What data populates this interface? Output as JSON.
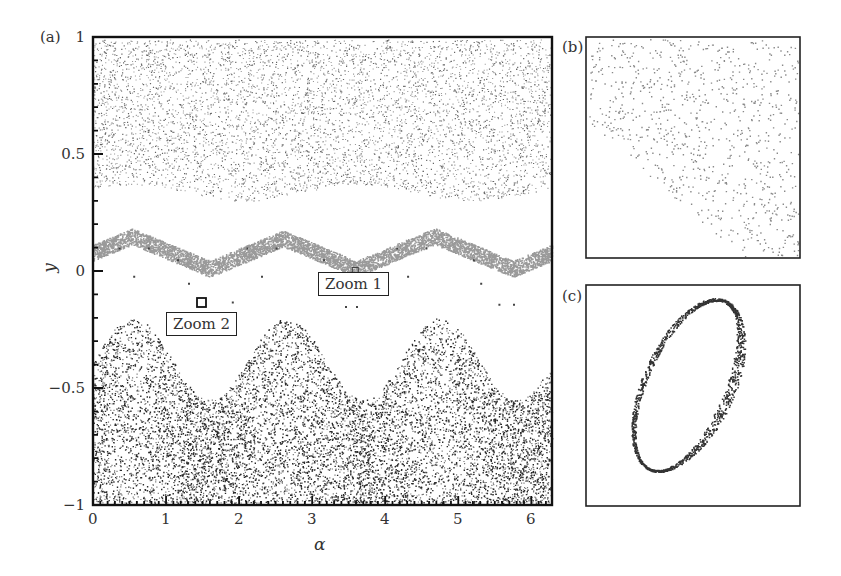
{
  "chart_data": [
    {
      "panel": "a",
      "type": "scatter",
      "title": "",
      "panel_label": "(a)",
      "xlabel": "α",
      "ylabel": "y",
      "xlim": [
        0,
        6.283
      ],
      "ylim": [
        -1,
        1
      ],
      "x_ticks": [
        "0",
        "1",
        "2",
        "3",
        "4",
        "5",
        "6"
      ],
      "y_ticks": [
        "−1",
        "−0.5",
        "0",
        "0.5",
        "1"
      ],
      "grid": false,
      "legend": null,
      "regions": [
        {
          "name": "upper chaotic sea",
          "color": "#444444",
          "y_lower_boundary": "≈0.30–0.37 (oscillating, period ≈3.14)",
          "y_upper": 1.0
        },
        {
          "name": "resonance band (gray)",
          "color": "#9a9a9a",
          "y_range_peaks": [
            0.11,
            0.18
          ],
          "y_troughs": 0.0,
          "trough_alpha": [
            1.6,
            3.6,
            5.75
          ]
        },
        {
          "name": "isolated islands (dots)",
          "color": "#444444",
          "y_values": [
            0.1,
            -0.04,
            -0.14
          ]
        },
        {
          "name": "lower chaotic sea",
          "color": "#222222",
          "upper_boundary_peaks_alpha": [
            0.55,
            2.65,
            4.75
          ],
          "upper_boundary_peak_y": -0.2,
          "upper_boundary_trough_y": -0.55,
          "y_lower": -1.0
        }
      ],
      "annotations": [
        {
          "text": "Zoom 1",
          "alpha": 3.7,
          "y": -0.05
        },
        {
          "text": "Zoom 2",
          "alpha": 1.5,
          "y": -0.13
        }
      ]
    },
    {
      "panel": "b",
      "type": "scatter",
      "panel_label": "(b)",
      "description": "Zoom 1: sparse gray points filling upper-right, empty lower-left triangle",
      "color": "#888888"
    },
    {
      "panel": "c",
      "type": "scatter",
      "panel_label": "(c)",
      "description": "Zoom 2: tilted elliptical ring of dark points (invariant torus)",
      "color": "#333333"
    }
  ],
  "labels": {
    "panel_a": "(a)",
    "panel_b": "(b)",
    "panel_c": "(c)",
    "x_title": "α",
    "y_title": "y",
    "zoom1": "Zoom 1",
    "zoom2": "Zoom 2",
    "x_ticks": [
      "0",
      "1",
      "2",
      "3",
      "4",
      "5",
      "6"
    ],
    "y_ticks": [
      "−1",
      "−0.5",
      "0",
      "0.5",
      "1"
    ]
  },
  "colors": {
    "axis": "#111111",
    "chaos_dark": "#2a2a2a",
    "chaos_light": "#666666",
    "band": "#9a9a9a",
    "zoom_b_points": "#8a8a8a",
    "zoom_c_points": "#333333"
  }
}
